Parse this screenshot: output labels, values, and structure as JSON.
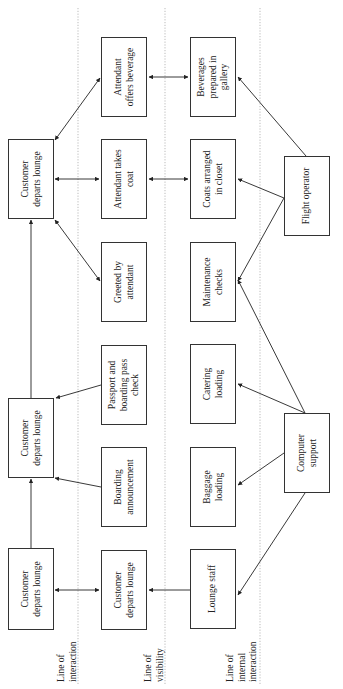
{
  "diagram": {
    "type": "service-blueprint",
    "orientation": "rotated-90-ccw",
    "lines": [
      {
        "id": "interaction",
        "label": "Line of\ninteraction"
      },
      {
        "id": "visibility",
        "label": "Line of\nvisibility"
      },
      {
        "id": "internal",
        "label": "Line of\ninternal\ninteraction"
      }
    ],
    "customer_actions": [
      {
        "id": "c1",
        "label": "Customer\ndeparts lounge"
      },
      {
        "id": "c2",
        "label": "Customer\ndeparts lounge"
      },
      {
        "id": "c3",
        "label": "Customer\ndeparts lounge"
      }
    ],
    "onstage": [
      {
        "id": "o1",
        "label": "Customer\ndeparts lounge"
      },
      {
        "id": "o2",
        "label": "Boarding\nannouncement"
      },
      {
        "id": "o3",
        "label": "Passport and\nboarding pass\ncheck"
      },
      {
        "id": "o4",
        "label": "Greeted by\nattendant"
      },
      {
        "id": "o5",
        "label": "Attendant takes\ncoat"
      },
      {
        "id": "o6",
        "label": "Attendant\noffers beverage"
      }
    ],
    "backstage": [
      {
        "id": "b1",
        "label": "Lounge staff"
      },
      {
        "id": "b2",
        "label": "Baggage\nloading"
      },
      {
        "id": "b3",
        "label": "Catering\nloading"
      },
      {
        "id": "b4",
        "label": "Maintenance\nchecks"
      },
      {
        "id": "b5",
        "label": "Coats arranged\nin closet"
      },
      {
        "id": "b6",
        "label": "Beverages\nprepared in\ngallery"
      }
    ],
    "support": [
      {
        "id": "s1",
        "label": "Computer\nsupport"
      },
      {
        "id": "s2",
        "label": "Flight operator"
      }
    ],
    "connections": [
      {
        "from": "c1",
        "to": "c2"
      },
      {
        "from": "c2",
        "to": "c3"
      },
      {
        "from": "c1",
        "to": "o1",
        "bidirectional": true
      },
      {
        "from": "b1",
        "to": "o1"
      },
      {
        "from": "o2",
        "to": "c2"
      },
      {
        "from": "o3",
        "to": "c2"
      },
      {
        "from": "c3",
        "to": "o4",
        "bidirectional": true
      },
      {
        "from": "c3",
        "to": "o5",
        "bidirectional": true
      },
      {
        "from": "c3",
        "to": "o6",
        "bidirectional": true
      },
      {
        "from": "o5",
        "to": "b5",
        "bidirectional": true
      },
      {
        "from": "o6",
        "to": "b6",
        "bidirectional": true
      },
      {
        "from": "s1",
        "to": "b1"
      },
      {
        "from": "s1",
        "to": "b2"
      },
      {
        "from": "s1",
        "to": "b3"
      },
      {
        "from": "s1",
        "to": "b4"
      },
      {
        "from": "s2",
        "to": "b4"
      },
      {
        "from": "s2",
        "to": "b5"
      },
      {
        "from": "s2",
        "to": "b6"
      }
    ]
  }
}
